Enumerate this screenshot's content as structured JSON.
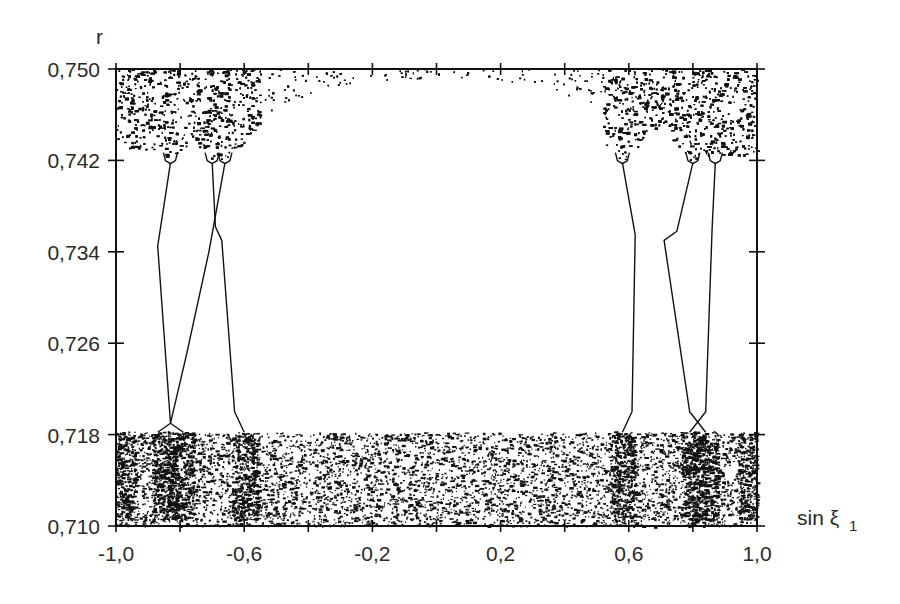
{
  "chart_data": {
    "type": "scatter",
    "title": "",
    "xlabel": "sin ξ",
    "xlabel_subscript": "1",
    "ylabel": "r",
    "xlim": [
      -1.0,
      1.0
    ],
    "ylim": [
      0.71,
      0.75
    ],
    "x_ticks": [
      -1.0,
      -0.8,
      -0.6,
      -0.4,
      -0.2,
      0.0,
      0.2,
      0.4,
      0.6,
      0.8,
      1.0
    ],
    "x_tick_labels": [
      {
        "value": -1.0,
        "label": "-1,0"
      },
      {
        "value": -0.6,
        "label": "-0,6"
      },
      {
        "value": -0.2,
        "label": "-0,2"
      },
      {
        "value": 0.2,
        "label": "0,2"
      },
      {
        "value": 0.6,
        "label": "0,6"
      },
      {
        "value": 1.0,
        "label": "1,0"
      }
    ],
    "y_ticks": [
      0.75,
      0.742,
      0.734,
      0.726,
      0.718,
      0.71
    ],
    "y_tick_labels": [
      {
        "value": 0.75,
        "label": "0,750"
      },
      {
        "value": 0.742,
        "label": "0,742"
      },
      {
        "value": 0.734,
        "label": "0,734"
      },
      {
        "value": 0.726,
        "label": "0,726"
      },
      {
        "value": 0.718,
        "label": "0,718"
      },
      {
        "value": 0.71,
        "label": "0,710"
      }
    ],
    "grid": false,
    "legend": null,
    "chaotic_regions": [
      {
        "name": "lower-chaotic-band",
        "x_range": [
          -1.0,
          1.0
        ],
        "r_range": [
          0.71,
          0.718
        ],
        "density": "high"
      },
      {
        "name": "upper-left-chaotic-band",
        "x_range": [
          -1.0,
          -0.55
        ],
        "r_range": [
          0.7425,
          0.75
        ],
        "density": "high"
      },
      {
        "name": "upper-center-sparse",
        "x_range": [
          -0.55,
          0.55
        ],
        "r_range": [
          0.7465,
          0.75
        ],
        "density": "low"
      },
      {
        "name": "upper-right-chaotic-band",
        "x_range": [
          0.55,
          1.0
        ],
        "r_range": [
          0.7425,
          0.75
        ],
        "density": "high"
      }
    ],
    "periodic_branches": [
      {
        "name": "left-branch-a",
        "points": [
          [
            -0.83,
            0.7418
          ],
          [
            -0.87,
            0.7345
          ],
          [
            -0.83,
            0.719
          ],
          [
            -0.79,
            0.7182
          ]
        ]
      },
      {
        "name": "left-branch-b",
        "points": [
          [
            -0.66,
            0.7418
          ],
          [
            -0.71,
            0.734
          ],
          [
            -0.78,
            0.725
          ],
          [
            -0.83,
            0.719
          ],
          [
            -0.87,
            0.7182
          ]
        ]
      },
      {
        "name": "left-branch-c",
        "points": [
          [
            -0.7,
            0.7418
          ],
          [
            -0.69,
            0.7362
          ],
          [
            -0.67,
            0.735
          ],
          [
            -0.63,
            0.72
          ],
          [
            -0.6,
            0.7182
          ]
        ]
      },
      {
        "name": "right-branch-a",
        "points": [
          [
            0.58,
            0.7418
          ],
          [
            0.62,
            0.7355
          ],
          [
            0.61,
            0.72
          ],
          [
            0.58,
            0.7182
          ]
        ]
      },
      {
        "name": "right-branch-b",
        "points": [
          [
            0.8,
            0.7418
          ],
          [
            0.75,
            0.7358
          ],
          [
            0.71,
            0.735
          ],
          [
            0.79,
            0.72
          ],
          [
            0.84,
            0.7182
          ]
        ]
      },
      {
        "name": "right-branch-c",
        "points": [
          [
            0.87,
            0.7418
          ],
          [
            0.86,
            0.736
          ],
          [
            0.84,
            0.72
          ],
          [
            0.79,
            0.7182
          ]
        ]
      }
    ]
  }
}
